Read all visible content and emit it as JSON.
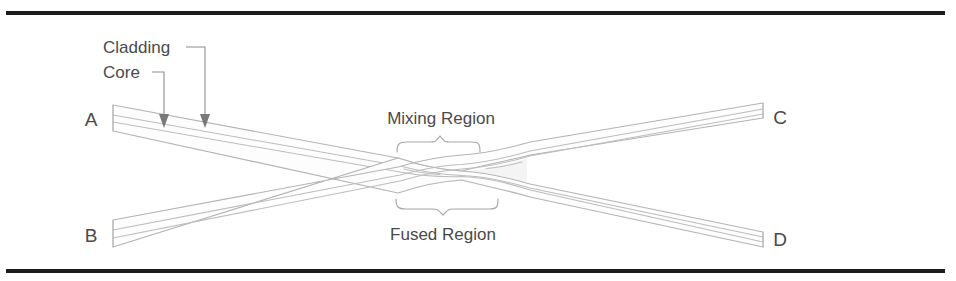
{
  "figure": {
    "background_color": "#ffffff",
    "rule_color": "#1c1c1c",
    "line_color": "#b4b4b4",
    "text_color": "#4a4a4a"
  },
  "callouts": {
    "cladding": "Cladding",
    "core": "Core"
  },
  "regions": {
    "mixing": "Mixing Region",
    "fused": "Fused Region"
  },
  "ports": {
    "a": "A",
    "b": "B",
    "c": "C",
    "d": "D"
  }
}
